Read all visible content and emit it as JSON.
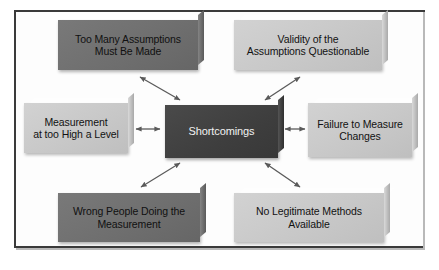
{
  "diagram": {
    "title_text": "Shortcomings",
    "center": {
      "id": "shortcomings",
      "label": "Shortcomings",
      "shade": "dark"
    },
    "nodes": [
      {
        "id": "too-many-assumptions",
        "position": "top-left",
        "line1": "Too Many Assumptions",
        "line2": "Must Be Made",
        "shade": "medium"
      },
      {
        "id": "validity-questionable",
        "position": "top-right",
        "line1": "Validity of the",
        "line2": "Assumptions Questionable",
        "shade": "light"
      },
      {
        "id": "measurement-too-high",
        "position": "left",
        "line1": "Measurement",
        "line2": "at too High a Level",
        "shade": "light"
      },
      {
        "id": "failure-to-measure-changes",
        "position": "right",
        "line1": "Failure to Measure",
        "line2": "Changes",
        "shade": "light"
      },
      {
        "id": "wrong-people-measuring",
        "position": "bottom-left",
        "line1": "Wrong People Doing the",
        "line2": "Measurement",
        "shade": "medium"
      },
      {
        "id": "no-legitimate-methods",
        "position": "bottom-right",
        "line1": "No Legitimate Methods",
        "line2": "Available",
        "shade": "light"
      }
    ],
    "connectors": [
      {
        "id": "connector-top-left",
        "from": "shortcomings",
        "to": "too-many-assumptions",
        "style": "double-arrow"
      },
      {
        "id": "connector-top-right",
        "from": "shortcomings",
        "to": "validity-questionable",
        "style": "double-arrow"
      },
      {
        "id": "connector-left",
        "from": "shortcomings",
        "to": "measurement-too-high",
        "style": "double-arrow"
      },
      {
        "id": "connector-right",
        "from": "shortcomings",
        "to": "failure-to-measure-changes",
        "style": "double-arrow"
      },
      {
        "id": "connector-bottom-left",
        "from": "shortcomings",
        "to": "wrong-people-measuring",
        "style": "double-arrow"
      },
      {
        "id": "connector-bottom-right",
        "from": "shortcomings",
        "to": "no-legitimate-methods",
        "style": "double-arrow"
      }
    ],
    "colors": {
      "dark_box": "#414141",
      "medium_box": "#6e6e6e",
      "light_box": "#c8c8c8",
      "connector": "#5a5a5a",
      "frame_border": "#3a3a3a",
      "background": "#ffffff",
      "dark_text": "#f2f2f2",
      "light_text": "#111111"
    }
  }
}
